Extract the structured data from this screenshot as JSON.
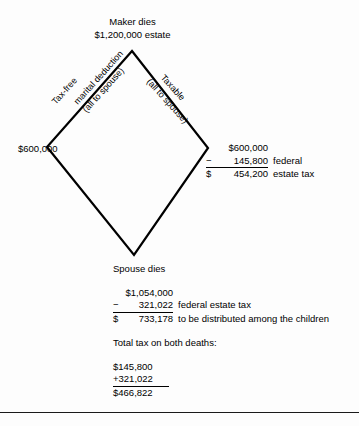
{
  "diagram": {
    "heading": {
      "line1": "Maker dies",
      "line2": "$1,200,000 estate"
    },
    "edges": {
      "left": {
        "top_label": "Tax-free",
        "sub_label_1": "marital deduction",
        "sub_label_2": "(all to spouse)"
      },
      "right": {
        "top_label": "Taxable",
        "sub_label_1": "(all to spouse)"
      }
    },
    "left_vertex": {
      "value": "$600,000"
    },
    "right_vertex": {
      "rows": [
        {
          "sign": "",
          "number": "$600,000",
          "note": ""
        },
        {
          "sign": "−",
          "number": "145,800",
          "note": "federal"
        },
        {
          "sign": "$",
          "number": "454,200",
          "note": "estate tax"
        }
      ]
    }
  },
  "spouse_section": {
    "title": "Spouse dies",
    "rows": [
      {
        "sign": "",
        "number": "$1,054,000",
        "note": ""
      },
      {
        "sign": "−",
        "number": "321,022",
        "note": "federal estate tax"
      },
      {
        "sign": "$",
        "number": "733,178",
        "note": "to be distributed among the children"
      }
    ]
  },
  "totals_section": {
    "title": "Total tax on both deaths:",
    "rows": [
      "$145,800",
      "+321,022",
      "$466,822"
    ]
  },
  "colors": {
    "ink": "#000000",
    "rule": "#1a1a1a",
    "page": "#fdfdfd"
  }
}
